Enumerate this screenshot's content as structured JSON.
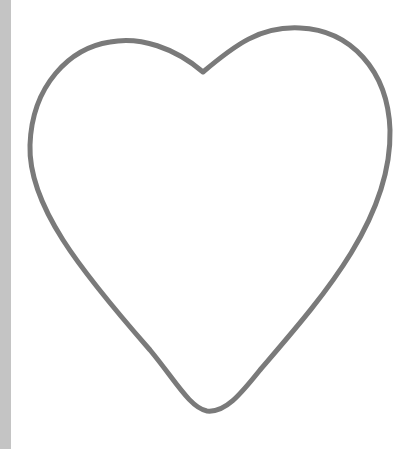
{
  "image": {
    "subject": "heart outline",
    "background_color": "#ffffff",
    "edge_strip_color": "#c4c4c4",
    "stroke_color": "#7a7a7a",
    "stroke_width": 5
  }
}
